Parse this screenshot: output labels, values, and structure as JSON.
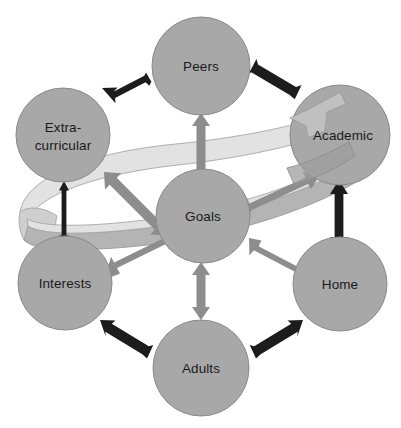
{
  "diagram": {
    "type": "node-network",
    "canvas": {
      "width": 401,
      "height": 428,
      "background": "#ffffff"
    },
    "palette": {
      "node_fill": "#a8a8a8",
      "node_stroke": "#8a8a8a",
      "label_color": "#1a1a1a",
      "arrow_dark": "#1c1c1c",
      "arrow_gray": "#8d8d8d",
      "ribbon_top": "#e2e2e2",
      "ribbon_under": "#b4b4b4"
    },
    "nodes": [
      {
        "id": "peers",
        "label": "Peers",
        "label_lines": [
          "Peers"
        ],
        "cx": 201,
        "cy": 66,
        "r": 49
      },
      {
        "id": "extracurricular",
        "label": "Extra-curricular",
        "label_lines": [
          "Extra-",
          "curricular"
        ],
        "cx": 63,
        "cy": 135,
        "r": 47
      },
      {
        "id": "academic",
        "label": "Academic",
        "label_lines": [
          "Academic"
        ],
        "cx": 340,
        "cy": 135,
        "r": 50
      },
      {
        "id": "goals",
        "label": "Goals",
        "label_lines": [
          "Goals"
        ],
        "cx": 203,
        "cy": 216,
        "r": 47
      },
      {
        "id": "interests",
        "label": "Interests",
        "label_lines": [
          "Interests"
        ],
        "cx": 65,
        "cy": 283,
        "r": 47
      },
      {
        "id": "home",
        "label": "Home",
        "label_lines": [
          "Home"
        ],
        "cx": 340,
        "cy": 284,
        "r": 47
      },
      {
        "id": "adults",
        "label": "Adults",
        "label_lines": [
          "Adults"
        ],
        "cx": 201,
        "cy": 368,
        "r": 48
      }
    ],
    "connections": [
      {
        "id": "goals-peers",
        "from": "goals",
        "to": "peers",
        "style": "gray",
        "bidirectional": true
      },
      {
        "id": "goals-extracurricular",
        "from": "goals",
        "to": "extracurricular",
        "style": "gray",
        "bidirectional": true
      },
      {
        "id": "goals-academic",
        "from": "goals",
        "to": "academic",
        "style": "gray",
        "bidirectional": true
      },
      {
        "id": "goals-interests",
        "from": "goals",
        "to": "interests",
        "style": "gray",
        "bidirectional": true
      },
      {
        "id": "goals-home",
        "from": "goals",
        "to": "home",
        "style": "gray",
        "bidirectional": true
      },
      {
        "id": "goals-adults",
        "from": "goals",
        "to": "adults",
        "style": "gray",
        "bidirectional": true
      },
      {
        "id": "extracurricular-peers",
        "from": "extracurricular",
        "to": "peers",
        "style": "dark",
        "bidirectional": true
      },
      {
        "id": "peers-academic",
        "from": "peers",
        "to": "academic",
        "style": "dark",
        "bidirectional": true
      },
      {
        "id": "extracurricular-interests",
        "from": "extracurricular",
        "to": "interests",
        "style": "dark",
        "bidirectional": true
      },
      {
        "id": "academic-home",
        "from": "academic",
        "to": "home",
        "style": "dark",
        "bidirectional": true
      },
      {
        "id": "interests-adults",
        "from": "interests",
        "to": "adults",
        "style": "dark",
        "bidirectional": true
      },
      {
        "id": "adults-home",
        "from": "adults",
        "to": "home",
        "style": "dark",
        "bidirectional": true
      }
    ],
    "ribbon": {
      "id": "encircling-ribbon",
      "description": "twisted elliptical band looping from lower-left around through Academic"
    }
  }
}
